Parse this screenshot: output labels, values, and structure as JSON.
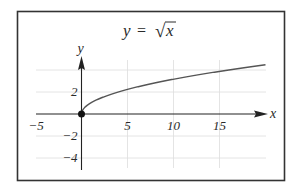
{
  "chart_data": {
    "type": "line",
    "title_parts": {
      "lhs": "y",
      "eq": "=",
      "radical": "√",
      "radicand": "x"
    },
    "xlabel": "x",
    "ylabel": "y",
    "xlim": [
      -5,
      20
    ],
    "ylim": [
      -5,
      5
    ],
    "x_ticks": [
      -5,
      5,
      10,
      15
    ],
    "x_tick_labels": [
      "−5",
      "5",
      "10",
      "15"
    ],
    "y_ticks": [
      2,
      -2,
      -4
    ],
    "y_tick_labels": [
      "2",
      "−2",
      "−4"
    ],
    "grid": true,
    "grid_x": [
      5,
      10,
      15
    ],
    "grid_y": [
      -4,
      -2,
      2,
      4
    ],
    "series": [
      {
        "name": "y = sqrt(x)",
        "x": [
          0,
          0.25,
          1,
          2,
          4,
          6,
          9,
          12,
          16,
          20
        ],
        "y": [
          0,
          0.5,
          1,
          1.414,
          2,
          2.449,
          3,
          3.464,
          4,
          4.472
        ]
      }
    ],
    "marked_points": [
      {
        "x": 0,
        "y": 0,
        "label": "origin"
      }
    ],
    "legend": "none",
    "colors": {
      "curve": "#555555",
      "axes": "#222222",
      "grid": "#dddddd",
      "frame": "#333333"
    }
  }
}
